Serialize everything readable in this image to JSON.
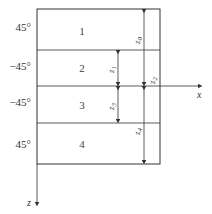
{
  "diagram": {
    "axes": {
      "x_label": "x",
      "z_label": "z"
    },
    "layers": [
      {
        "number": "1",
        "angle": "45°"
      },
      {
        "number": "2",
        "angle": "−45°"
      },
      {
        "number": "3",
        "angle": "−45°"
      },
      {
        "number": "4",
        "angle": "45°"
      }
    ],
    "dimensions": [
      {
        "label": "z0",
        "base": "z",
        "sub": "0"
      },
      {
        "label": "z1",
        "base": "z",
        "sub": "1"
      },
      {
        "label": "z2",
        "base": "z",
        "sub": "2"
      },
      {
        "label": "z3",
        "base": "z",
        "sub": "3"
      },
      {
        "label": "z4",
        "base": "z",
        "sub": "4"
      }
    ],
    "colors": {
      "line": "#333333",
      "background": "#ffffff"
    }
  }
}
